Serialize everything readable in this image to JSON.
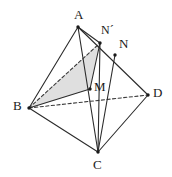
{
  "figure": {
    "background_color": "#ffffff",
    "stroke_color": "#2b2b2b",
    "dashed_color": "#3a3a3a",
    "shade_fill": "#d9d9d9",
    "shade_opacity": 0.85,
    "point_color": "#1a1a1a",
    "label_color": "#1a1a1a",
    "stroke_width": 1.1,
    "dash_pattern": "3.2,2.4"
  },
  "vertices": [
    {
      "id": "A",
      "label": "A",
      "x": 78,
      "y": 27,
      "label_x": 74,
      "label_y": 8,
      "size": "normal"
    },
    {
      "id": "B",
      "label": "B",
      "x": 29,
      "y": 108,
      "label_x": 13,
      "label_y": 99,
      "size": "normal"
    },
    {
      "id": "C",
      "label": "C",
      "x": 98,
      "y": 152,
      "label_x": 93,
      "label_y": 158,
      "size": "normal"
    },
    {
      "id": "D",
      "label": "D",
      "x": 148,
      "y": 95,
      "label_x": 153,
      "label_y": 86,
      "size": "normal"
    },
    {
      "id": "M",
      "label": "M",
      "x": 90,
      "y": 89,
      "label_x": 94,
      "label_y": 80,
      "size": "normal"
    },
    {
      "id": "N",
      "label": "N",
      "x": 115,
      "y": 55,
      "label_x": 119,
      "label_y": 37,
      "size": "normal"
    },
    {
      "id": "Np",
      "label": "N´",
      "x": 100,
      "y": 43,
      "label_x": 101,
      "label_y": 24,
      "size": "small"
    }
  ],
  "edges": [
    {
      "id": "AB",
      "from": "A",
      "to": "B",
      "style": "solid",
      "name": "edge-a-b"
    },
    {
      "id": "AC",
      "from": "A",
      "to": "C",
      "style": "solid",
      "name": "edge-a-c"
    },
    {
      "id": "AD",
      "from": "A",
      "to": "D",
      "style": "solid",
      "name": "edge-a-d"
    },
    {
      "id": "BC",
      "from": "B",
      "to": "C",
      "style": "solid",
      "name": "edge-b-c"
    },
    {
      "id": "CD",
      "from": "C",
      "to": "D",
      "style": "solid",
      "name": "edge-c-d"
    },
    {
      "id": "BD",
      "from": "B",
      "to": "D",
      "style": "dashed",
      "name": "edge-b-d-hidden"
    },
    {
      "id": "BNp",
      "from": "B",
      "to": "Np",
      "style": "dashed",
      "name": "segment-b-nprime"
    },
    {
      "id": "BM",
      "from": "B",
      "to": "M",
      "style": "solid",
      "name": "segment-b-m"
    },
    {
      "id": "NpC",
      "from": "Np",
      "to": "C",
      "style": "solid",
      "name": "segment-nprime-c"
    },
    {
      "id": "NC",
      "from": "N",
      "to": "C",
      "style": "solid",
      "name": "segment-n-c"
    },
    {
      "id": "ANp",
      "from": "A",
      "to": "Np",
      "style": "solid",
      "name": "segment-a-nprime"
    },
    {
      "id": "MNp",
      "from": "M",
      "to": "Np",
      "style": "solid",
      "name": "segment-m-nprime"
    }
  ],
  "shaded_regions": [
    {
      "id": "BMNp",
      "name": "shaded-triangle-b-m-nprime",
      "points": [
        "B",
        "M",
        "Np"
      ],
      "fill": "#d9d9d9"
    }
  ]
}
